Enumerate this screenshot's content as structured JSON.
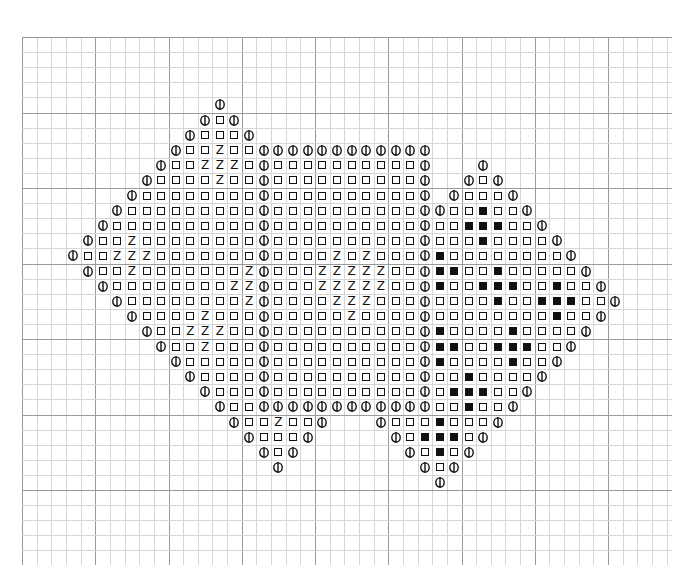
{
  "chart_data": {
    "type": "table",
    "title": "",
    "grid": {
      "cols": 45,
      "rows": 35,
      "major_every": 5,
      "origin_px": [
        22,
        37
      ],
      "cell_px": [
        14.65,
        15.1
      ]
    },
    "legend": {
      "O": "circle-with-vertical-bar symbol",
      "S": "open square symbol",
      "Z": "Z letter symbol",
      "B": "filled black square symbol",
      ".": "empty"
    },
    "colors": {
      "ink": "#111111",
      "minor_grid": "#d6d6d6",
      "major_grid": "#9a9a9a",
      "background": "#ffffff"
    },
    "rows": [
      {
        "row": 4,
        "start": 13,
        "cells": "O"
      },
      {
        "row": 5,
        "start": 12,
        "cells": "OSO"
      },
      {
        "row": 6,
        "start": 11,
        "cells": "OSSSO"
      },
      {
        "row": 7,
        "start": 10,
        "cells": "OSSZSSOOOOOOOOOOOO"
      },
      {
        "row": 8,
        "start": 9,
        "cells": "OSSZZZSOSSSSSSSSSSO...O"
      },
      {
        "row": 9,
        "start": 8,
        "cells": "OSSSSZSSOSSSSSSSSSSO..OSO"
      },
      {
        "row": 10,
        "start": 7,
        "cells": "OSSSSSSSSOSSSSSSSSSSO.OSSSO"
      },
      {
        "row": 11,
        "start": 6,
        "cells": "OSSSSSSSSSOSSSSSSSSSSOOSSBSSO"
      },
      {
        "row": 12,
        "start": 5,
        "cells": "OSSSSSSSSSSOSSSSSSSSSSOSSBBBSSO"
      },
      {
        "row": 13,
        "start": 4,
        "cells": "OSSZSSSSSSSSOSSSSSSSSSSOSSSBSSSSO"
      },
      {
        "row": 14,
        "start": 3,
        "cells": "OSSZZZSSSSSSSOSSSSZSZSSSOBSSSSSSSSO"
      },
      {
        "row": 15,
        "start": 4,
        "cells": "OSSZSSSSSSSZOSSSZZZZZSSOBBSSBSSSSSO"
      },
      {
        "row": 16,
        "start": 5,
        "cells": "OSSSSSSSSZZOSSSZZZZZSSOBSSBBBSSBSSO"
      },
      {
        "row": 17,
        "start": 6,
        "cells": "OSSSSSSSSZOSSSSZZZSSSOSSSSBSSBBBSSO"
      },
      {
        "row": 18,
        "start": 7,
        "cells": "OSSSSZSSSOSSSSSZSSSSOSSSSSSSSBSSO"
      },
      {
        "row": 19,
        "start": 8,
        "cells": "OSSZZZSSOSSSSSSSSSSOBSSSSBSSSSO"
      },
      {
        "row": 20,
        "start": 9,
        "cells": "OSSZSSSOSSSSSSSSSSOBBSSBBBSSO"
      },
      {
        "row": 21,
        "start": 10,
        "cells": "OSSSSSOSSSSSSSSSSOBSSSSBSSO"
      },
      {
        "row": 22,
        "start": 11,
        "cells": "OSSSSOSSSSSSSSSSOSSBSSSSO"
      },
      {
        "row": 23,
        "start": 12,
        "cells": "OSSSOSSSSSSSSSSOSBBBSSO"
      },
      {
        "row": 24,
        "start": 13,
        "cells": "OSSOOOOOOOOOOOOSSBSSO"
      },
      {
        "row": 25,
        "start": 14,
        "cells": "OSSZSSO...OSSSBSSSO"
      },
      {
        "row": 26,
        "start": 15,
        "cells": "OSSSO.....OSBBBSO"
      },
      {
        "row": 27,
        "start": 16,
        "cells": "OSO.......OSBSO"
      },
      {
        "row": 28,
        "start": 17,
        "cells": "O.........OSO"
      },
      {
        "row": 29,
        "start": 28,
        "cells": "O"
      }
    ]
  }
}
